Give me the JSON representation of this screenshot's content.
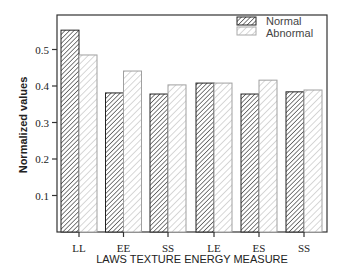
{
  "chart_data": {
    "type": "bar",
    "title": "",
    "xlabel": "LAWS TEXTURE ENERGY MEASURE",
    "ylabel": "Normalized values",
    "categories": [
      "LL",
      "EE",
      "SS",
      "LE",
      "ES",
      "SS"
    ],
    "series": [
      {
        "name": "Normal",
        "values": [
          0.553,
          0.381,
          0.378,
          0.408,
          0.378,
          0.384
        ],
        "pattern": "dense-dark-hatch",
        "color": "#444444"
      },
      {
        "name": "Abnormal",
        "values": [
          0.485,
          0.441,
          0.403,
          0.408,
          0.416,
          0.389
        ],
        "pattern": "sparse-light-hatch",
        "color": "#aaaaaa"
      }
    ],
    "yticks": [
      0.1,
      0.2,
      0.3,
      0.4,
      0.5
    ],
    "ytick_labels": [
      "0.1",
      "0.2",
      "0.3",
      "0.4",
      "0.5"
    ],
    "ylim": [
      0,
      0.597
    ],
    "grid": false,
    "legend_position": "upper right"
  }
}
